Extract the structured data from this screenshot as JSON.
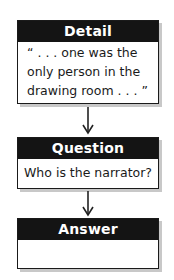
{
  "diagram": {
    "type": "flowchart",
    "boxes": [
      {
        "id": "detail",
        "header": "Detail",
        "body": "“ . . . one was the\nonly person in the\ndrawing room . . . ”"
      },
      {
        "id": "question",
        "header": "Question",
        "body": "Who is the narrator?"
      },
      {
        "id": "answer",
        "header": "Answer",
        "body": ""
      }
    ],
    "arrows": [
      {
        "from": "detail",
        "to": "question"
      },
      {
        "from": "question",
        "to": "answer"
      }
    ],
    "colors": {
      "header_bg": "#141414",
      "header_text": "#ffffff",
      "border": "#1a1a1a",
      "shadow": "#c8c8c8",
      "body_text": "#1a1a1a"
    }
  }
}
